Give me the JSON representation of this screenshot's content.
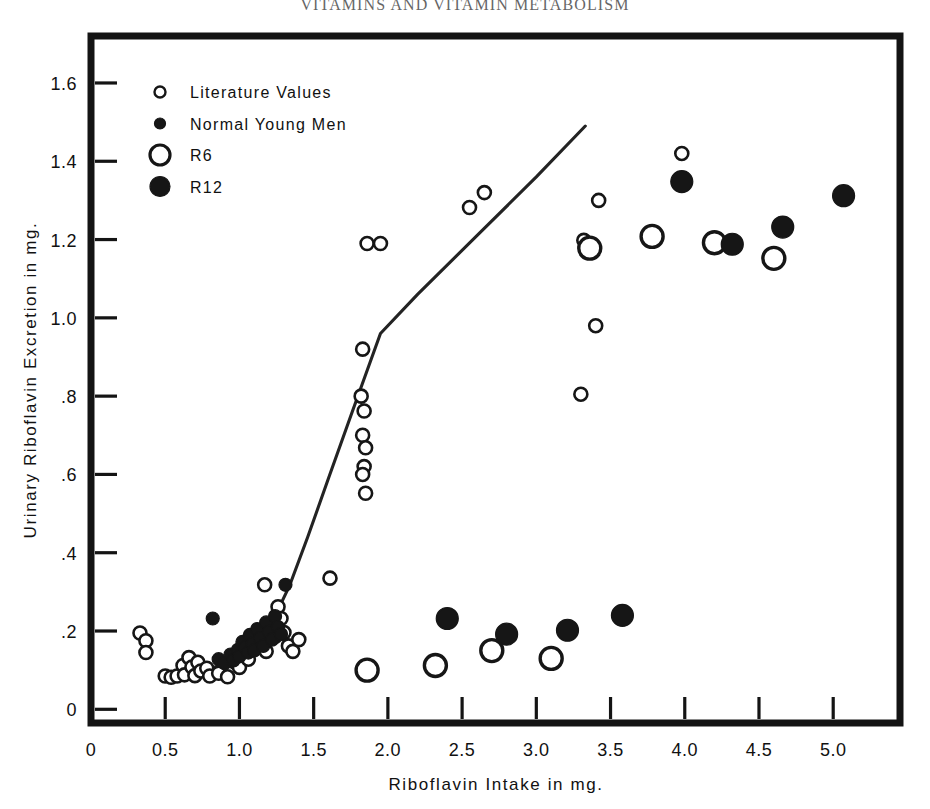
{
  "running_head": "VITAMINS AND VITAMIN METABOLISM",
  "chart_data": {
    "type": "scatter",
    "title": "",
    "xlabel": "Riboflavin  Intake in mg.",
    "ylabel": "Urinary  Riboflavin  Excretion  in mg.",
    "xlim": [
      0,
      5.45
    ],
    "ylim": [
      -0.035,
      1.72
    ],
    "grid": false,
    "legend_position": "top-left",
    "xticks": [
      "0",
      "0.5",
      "1.0",
      "1.5",
      "2.0",
      "2.5",
      "3.0",
      "3.5",
      "4.0",
      "4.5",
      "5.0"
    ],
    "xtick_values": [
      0,
      0.5,
      1.0,
      1.5,
      2.0,
      2.5,
      3.0,
      3.5,
      4.0,
      4.5,
      5.0
    ],
    "yticks": [
      "0",
      ".2",
      ".4",
      ".6",
      ".8",
      "1.0",
      "1.2",
      "1.4",
      "1.6"
    ],
    "ytick_values": [
      0,
      0.2,
      0.4,
      0.6,
      0.8,
      1.0,
      1.2,
      1.4,
      1.6
    ],
    "legend": [
      {
        "name": "literature-values",
        "label": "Literature  Values",
        "marker": "open-circle-small",
        "radius": 5.5,
        "filled": false
      },
      {
        "name": "normal-young-men",
        "label": "Normal  Young  Men",
        "marker": "filled-circle-small",
        "radius": 5.5,
        "filled": true
      },
      {
        "name": "r6",
        "label": "R6",
        "marker": "open-circle-large",
        "radius": 10,
        "filled": false
      },
      {
        "name": "r12",
        "label": "R12",
        "marker": "filled-circle-large",
        "radius": 10,
        "filled": true
      }
    ],
    "series": [
      {
        "name": "Literature Values",
        "marker": "open-circle-small",
        "filled": false,
        "radius": 6.5,
        "points": [
          [
            0.33,
            0.195
          ],
          [
            0.37,
            0.175
          ],
          [
            0.37,
            0.145
          ],
          [
            0.5,
            0.085
          ],
          [
            0.54,
            0.082
          ],
          [
            0.58,
            0.085
          ],
          [
            0.62,
            0.112
          ],
          [
            0.63,
            0.088
          ],
          [
            0.66,
            0.132
          ],
          [
            0.68,
            0.108
          ],
          [
            0.7,
            0.086
          ],
          [
            0.72,
            0.12
          ],
          [
            0.74,
            0.098
          ],
          [
            0.78,
            0.105
          ],
          [
            0.8,
            0.085
          ],
          [
            0.86,
            0.092
          ],
          [
            0.92,
            0.083
          ],
          [
            0.97,
            0.12
          ],
          [
            1.0,
            0.107
          ],
          [
            1.04,
            0.148
          ],
          [
            1.06,
            0.128
          ],
          [
            1.12,
            0.16
          ],
          [
            1.17,
            0.318
          ],
          [
            1.18,
            0.148
          ],
          [
            1.22,
            0.212
          ],
          [
            1.24,
            0.186
          ],
          [
            1.26,
            0.262
          ],
          [
            1.28,
            0.232
          ],
          [
            1.3,
            0.196
          ],
          [
            1.33,
            0.162
          ],
          [
            1.36,
            0.148
          ],
          [
            1.4,
            0.178
          ],
          [
            1.61,
            0.335
          ],
          [
            1.83,
            0.92
          ],
          [
            1.82,
            0.8
          ],
          [
            1.84,
            0.762
          ],
          [
            1.83,
            0.7
          ],
          [
            1.85,
            0.668
          ],
          [
            1.84,
            0.62
          ],
          [
            1.83,
            0.6
          ],
          [
            1.85,
            0.552
          ],
          [
            1.86,
            1.19
          ],
          [
            1.95,
            1.19
          ],
          [
            2.55,
            1.282
          ],
          [
            2.65,
            1.32
          ],
          [
            3.32,
            1.198
          ],
          [
            3.34,
            1.178
          ],
          [
            3.3,
            0.805
          ],
          [
            3.4,
            0.98
          ],
          [
            3.42,
            1.3
          ],
          [
            3.98,
            1.42
          ]
        ]
      },
      {
        "name": "Normal Young Men",
        "marker": "filled-circle-small",
        "filled": true,
        "radius": 6.5,
        "points": [
          [
            0.82,
            0.232
          ],
          [
            0.86,
            0.128
          ],
          [
            0.9,
            0.118
          ],
          [
            0.94,
            0.14
          ],
          [
            0.96,
            0.125
          ],
          [
            0.99,
            0.152
          ],
          [
            1.0,
            0.135
          ],
          [
            1.02,
            0.172
          ],
          [
            1.04,
            0.158
          ],
          [
            1.06,
            0.145
          ],
          [
            1.07,
            0.19
          ],
          [
            1.09,
            0.168
          ],
          [
            1.1,
            0.15
          ],
          [
            1.12,
            0.205
          ],
          [
            1.14,
            0.182
          ],
          [
            1.16,
            0.162
          ],
          [
            1.18,
            0.222
          ],
          [
            1.2,
            0.198
          ],
          [
            1.22,
            0.178
          ],
          [
            1.24,
            0.238
          ],
          [
            1.26,
            0.21
          ],
          [
            1.28,
            0.192
          ],
          [
            1.31,
            0.318
          ]
        ]
      },
      {
        "name": "R6",
        "marker": "open-circle-large",
        "filled": false,
        "radius": 11,
        "points": [
          [
            1.86,
            0.1
          ],
          [
            2.32,
            0.112
          ],
          [
            2.7,
            0.15
          ],
          [
            3.1,
            0.13
          ],
          [
            3.36,
            1.178
          ],
          [
            3.78,
            1.208
          ],
          [
            4.2,
            1.192
          ],
          [
            4.6,
            1.152
          ]
        ]
      },
      {
        "name": "R12",
        "marker": "filled-circle-large",
        "filled": true,
        "radius": 11,
        "points": [
          [
            2.4,
            0.232
          ],
          [
            2.8,
            0.192
          ],
          [
            3.21,
            0.202
          ],
          [
            3.58,
            0.24
          ],
          [
            3.98,
            1.348
          ],
          [
            4.32,
            1.188
          ],
          [
            4.66,
            1.232
          ],
          [
            5.07,
            1.312
          ]
        ]
      }
    ],
    "fit_line": {
      "name": "fitted-regression-curve",
      "points": [
        [
          0.545,
          0.082
        ],
        [
          0.7,
          0.092
        ],
        [
          0.85,
          0.11
        ],
        [
          1.0,
          0.14
        ],
        [
          1.12,
          0.178
        ],
        [
          1.24,
          0.238
        ],
        [
          1.34,
          0.318
        ],
        [
          1.46,
          0.44
        ],
        [
          1.6,
          0.59
        ],
        [
          1.76,
          0.76
        ],
        [
          1.95,
          0.96
        ],
        [
          2.2,
          1.06
        ],
        [
          2.6,
          1.21
        ],
        [
          3.0,
          1.36
        ],
        [
          3.33,
          1.49
        ]
      ]
    }
  }
}
